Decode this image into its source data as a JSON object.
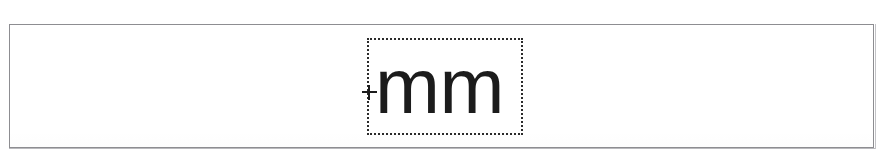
{
  "document": {
    "frame_label": "scanned-page-region",
    "background_color": "#ffffff",
    "border_color": "#8d8d91"
  },
  "selection": {
    "text": "mm",
    "border_style": "dotted",
    "border_color": "#2b2b2b",
    "text_color": "#1c1c1c",
    "caret_symbol": "+"
  }
}
